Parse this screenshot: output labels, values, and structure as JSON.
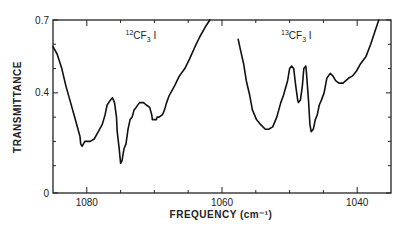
{
  "chart_data": {
    "type": "line",
    "title": "",
    "xlabel": "FREQUENCY (cm⁻¹)",
    "ylabel": "TRANSMITTANCE",
    "xlim": [
      1085,
      1035
    ],
    "ylim": [
      0,
      0.7
    ],
    "x_reversed": true,
    "grid": false,
    "legend": "none",
    "x_ticks": [
      1080,
      1060,
      1040
    ],
    "x_tick_labels": [
      "1080",
      "1060",
      "1040"
    ],
    "x_minor_ticks": [
      1085,
      1075,
      1070,
      1065,
      1055,
      1050,
      1045,
      1035
    ],
    "y_ticks": [
      0,
      0.4,
      0.7
    ],
    "y_tick_labels": [
      "0",
      "0.4",
      "0.7"
    ],
    "annotations": [
      {
        "text": "12CF3 I",
        "sup": "12",
        "main": "CF",
        "sub": "3",
        "tail": " I",
        "x": 1072,
        "y": 0.62
      },
      {
        "text": "13CF3 I",
        "sup": "13",
        "main": "CF",
        "sub": "3",
        "tail": " I",
        "x": 1049,
        "y": 0.62
      }
    ],
    "series": [
      {
        "name": "12CF3I",
        "x": [
          1085.0,
          1084.4,
          1083.7,
          1083.1,
          1082.5,
          1081.9,
          1081.3,
          1081.0,
          1080.9,
          1080.7,
          1080.3,
          1079.8,
          1079.5,
          1078.9,
          1078.3,
          1077.7,
          1077.3,
          1077.0,
          1076.5,
          1076.2,
          1075.9,
          1075.6,
          1075.5,
          1075.2,
          1075.0,
          1074.8,
          1074.5,
          1074.2,
          1073.9,
          1073.6,
          1073.3,
          1073.0,
          1072.7,
          1072.2,
          1071.6,
          1071.2,
          1070.7,
          1070.4,
          1070.3,
          1070.0,
          1069.7,
          1069.6,
          1069.3,
          1068.8,
          1068.5,
          1068.2,
          1067.8,
          1067.0,
          1066.3,
          1065.5,
          1064.8,
          1064.0,
          1063.3,
          1062.5,
          1061.8
        ],
        "y": [
          0.59,
          0.56,
          0.5,
          0.43,
          0.37,
          0.31,
          0.25,
          0.22,
          0.19,
          0.18,
          0.2,
          0.2,
          0.2,
          0.21,
          0.24,
          0.27,
          0.31,
          0.35,
          0.37,
          0.38,
          0.36,
          0.3,
          0.24,
          0.17,
          0.11,
          0.12,
          0.17,
          0.19,
          0.25,
          0.29,
          0.3,
          0.33,
          0.34,
          0.36,
          0.36,
          0.35,
          0.34,
          0.31,
          0.29,
          0.29,
          0.29,
          0.3,
          0.3,
          0.31,
          0.33,
          0.36,
          0.39,
          0.43,
          0.47,
          0.5,
          0.54,
          0.59,
          0.63,
          0.67,
          0.7
        ]
      },
      {
        "name": "13CF3I",
        "x": [
          1057.6,
          1057.3,
          1056.8,
          1056.4,
          1055.9,
          1055.5,
          1054.9,
          1054.3,
          1053.6,
          1053.1,
          1052.5,
          1051.9,
          1051.3,
          1050.9,
          1050.3,
          1050.0,
          1049.7,
          1049.4,
          1049.1,
          1048.8,
          1048.7,
          1048.4,
          1048.1,
          1047.9,
          1047.6,
          1047.5,
          1047.2,
          1047.0,
          1046.8,
          1046.5,
          1046.2,
          1045.9,
          1045.6,
          1045.3,
          1044.9,
          1044.5,
          1044.0,
          1043.6,
          1043.2,
          1042.7,
          1042.1,
          1041.3,
          1040.7,
          1040.1,
          1039.5,
          1038.7,
          1038.0,
          1037.3,
          1036.8
        ],
        "y": [
          0.62,
          0.58,
          0.52,
          0.45,
          0.39,
          0.33,
          0.29,
          0.27,
          0.25,
          0.25,
          0.26,
          0.3,
          0.36,
          0.39,
          0.45,
          0.5,
          0.51,
          0.5,
          0.43,
          0.37,
          0.36,
          0.37,
          0.43,
          0.5,
          0.51,
          0.48,
          0.37,
          0.27,
          0.24,
          0.25,
          0.29,
          0.31,
          0.35,
          0.37,
          0.4,
          0.46,
          0.48,
          0.47,
          0.45,
          0.44,
          0.44,
          0.46,
          0.47,
          0.49,
          0.52,
          0.55,
          0.6,
          0.66,
          0.7
        ]
      }
    ]
  }
}
